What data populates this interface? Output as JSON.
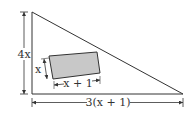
{
  "diagram": {
    "colors": {
      "stroke": "#333333",
      "rect_fill": "#c8c8c8",
      "background": "#ffffff"
    },
    "triangle": {
      "vertices": [
        [
          32,
          12
        ],
        [
          32,
          94
        ],
        [
          183,
          94
        ]
      ]
    },
    "inner_rectangle": {
      "corners": [
        [
          49,
          56
        ],
        [
          97,
          52
        ],
        [
          100,
          73
        ],
        [
          53,
          79
        ]
      ]
    },
    "labels": {
      "left_side": "4x",
      "bottom_side": "3(x + 1)",
      "rect_height": "x",
      "rect_width": "x + 1"
    }
  }
}
